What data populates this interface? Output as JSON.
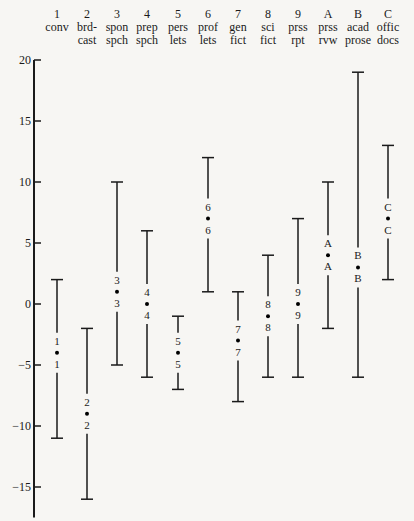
{
  "chart_data": {
    "type": "range",
    "title": "",
    "xlabel": "",
    "ylabel": "",
    "ylim": [
      -17,
      20
    ],
    "yticks": [
      20,
      15,
      10,
      5,
      0,
      -5,
      -10,
      -15
    ],
    "grid": false,
    "legend": "none",
    "categories": [
      {
        "code": "1",
        "label_line1": "conv",
        "label_line2": "",
        "max": 2,
        "mean": -4,
        "min": -11
      },
      {
        "code": "2",
        "label_line1": "brd-",
        "label_line2": "cast",
        "max": -2,
        "mean": -9,
        "min": -16
      },
      {
        "code": "3",
        "label_line1": "spon",
        "label_line2": "spch",
        "max": 10,
        "mean": 1,
        "min": -5
      },
      {
        "code": "4",
        "label_line1": "prep",
        "label_line2": "spch",
        "max": 6,
        "mean": 0,
        "min": -6
      },
      {
        "code": "5",
        "label_line1": "pers",
        "label_line2": "lets",
        "max": -1,
        "mean": -4,
        "min": -7
      },
      {
        "code": "6",
        "label_line1": "prof",
        "label_line2": "lets",
        "max": 12,
        "mean": 7,
        "min": 1
      },
      {
        "code": "7",
        "label_line1": "gen",
        "label_line2": "fict",
        "max": 1,
        "mean": -3,
        "min": -8
      },
      {
        "code": "8",
        "label_line1": "sci",
        "label_line2": "fict",
        "max": 4,
        "mean": -1,
        "min": -6
      },
      {
        "code": "9",
        "label_line1": "prss",
        "label_line2": "rpt",
        "max": 7,
        "mean": 0,
        "min": -6
      },
      {
        "code": "A",
        "label_line1": "prss",
        "label_line2": "rvw",
        "max": 10,
        "mean": 4,
        "min": -2
      },
      {
        "code": "B",
        "label_line1": "acad",
        "label_line2": "prose",
        "max": 19,
        "mean": 3,
        "min": -6
      },
      {
        "code": "C",
        "label_line1": "offic",
        "label_line2": "docs",
        "max": 13,
        "mean": 7,
        "min": 2
      }
    ],
    "caption": "Figure (caption cut off)"
  },
  "figure": {
    "caption_visible": ""
  }
}
